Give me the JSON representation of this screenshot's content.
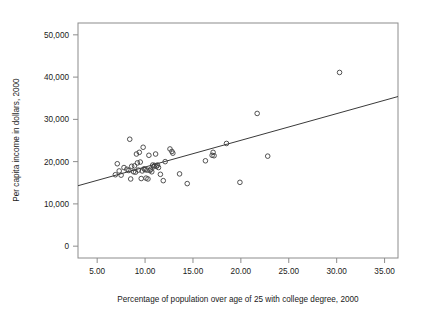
{
  "figure": {
    "background_color": "#ffffff",
    "point_color": "#404040",
    "line_color": "#3a3a3a",
    "frame_color": "#8c8c8c"
  },
  "chart_data": {
    "type": "scatter",
    "title": "",
    "xlabel": "Percentage of population over age of 25 with college degree, 2000",
    "ylabel": "Per capita income in dollars, 2000",
    "xlim": [
      3.0,
      36.4
    ],
    "ylim": [
      -2800,
      52800
    ],
    "grid": false,
    "legend": null,
    "xticks": [
      5,
      10,
      15,
      20,
      25,
      30,
      35
    ],
    "xticklabels": [
      "5.00",
      "10.00",
      "15.00",
      "20.00",
      "25.00",
      "30.00",
      "35.00"
    ],
    "yticks": [
      0,
      10000,
      20000,
      30000,
      40000,
      50000
    ],
    "yticklabels": [
      "0",
      "10,000",
      "20,000",
      "30,000",
      "40,000",
      "50,000"
    ],
    "series": [
      {
        "name": "states",
        "marker": "open-circle",
        "points": [
          [
            6.9,
            16900
          ],
          [
            7.1,
            19500
          ],
          [
            7.3,
            17800
          ],
          [
            7.5,
            16800
          ],
          [
            7.8,
            18600
          ],
          [
            8.1,
            18200
          ],
          [
            8.3,
            17900
          ],
          [
            8.4,
            25300
          ],
          [
            8.5,
            15900
          ],
          [
            8.6,
            18900
          ],
          [
            8.8,
            17600
          ],
          [
            8.9,
            19000
          ],
          [
            9.0,
            17500
          ],
          [
            9.1,
            21800
          ],
          [
            9.2,
            19700
          ],
          [
            9.3,
            18000
          ],
          [
            9.4,
            22200
          ],
          [
            9.5,
            19900
          ],
          [
            9.6,
            16000
          ],
          [
            9.7,
            17800
          ],
          [
            9.8,
            23400
          ],
          [
            9.9,
            18300
          ],
          [
            10.0,
            18100
          ],
          [
            10.1,
            16100
          ],
          [
            10.2,
            18000
          ],
          [
            10.3,
            15900
          ],
          [
            10.4,
            21500
          ],
          [
            10.5,
            17900
          ],
          [
            10.6,
            18200
          ],
          [
            10.7,
            17600
          ],
          [
            10.8,
            19200
          ],
          [
            10.9,
            18800
          ],
          [
            11.0,
            19100
          ],
          [
            11.1,
            21800
          ],
          [
            11.2,
            18900
          ],
          [
            11.3,
            19200
          ],
          [
            11.4,
            18600
          ],
          [
            11.6,
            17000
          ],
          [
            11.9,
            15500
          ],
          [
            12.1,
            20000
          ],
          [
            12.6,
            23000
          ],
          [
            12.8,
            22400
          ],
          [
            12.9,
            22000
          ],
          [
            13.6,
            17100
          ],
          [
            14.4,
            14800
          ],
          [
            16.3,
            20200
          ],
          [
            17.0,
            21500
          ],
          [
            17.1,
            22200
          ],
          [
            17.2,
            21400
          ],
          [
            18.5,
            24300
          ],
          [
            19.9,
            15100
          ],
          [
            21.7,
            31400
          ],
          [
            22.8,
            21300
          ],
          [
            30.3,
            41100
          ]
        ]
      }
    ],
    "fit_line": {
      "name": "linear-fit",
      "x_start": 3.0,
      "y_start": 14300,
      "x_end": 36.4,
      "y_end": 35400
    }
  }
}
